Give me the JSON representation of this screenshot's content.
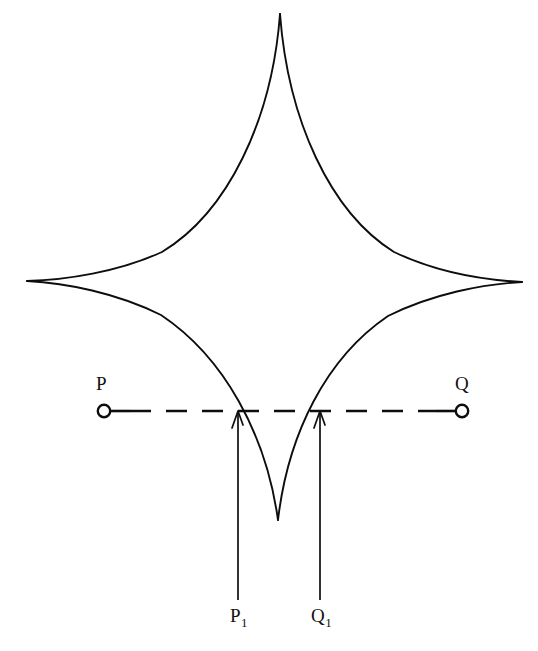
{
  "figure": {
    "kind": "geometric-diagram",
    "background_color": "#ffffff",
    "stroke_color": "#0d0d0d",
    "width": 538,
    "height": 651
  },
  "curve": {
    "name": "astroid",
    "cusp_count": 4,
    "center": {
      "x": 275,
      "y": 281
    },
    "semi_axis_x": 247,
    "semi_axis_y": 267,
    "cusps": {
      "top": {
        "x": 280,
        "y": 14
      },
      "bottom": {
        "x": 278,
        "y": 520
      },
      "left": {
        "x": 27,
        "y": 281
      },
      "right": {
        "x": 522,
        "y": 282
      }
    },
    "stroke_width": 1.9
  },
  "chord": {
    "y": 411,
    "x_start": 104,
    "x_end": 462,
    "dash_on": 21,
    "dash_off": 15,
    "stroke_width": 2.6,
    "endpoint_radius": 6.2
  },
  "labels": {
    "p": "P",
    "q": "Q",
    "p1_base": "P",
    "p1_sub": "1",
    "q1_base": "Q",
    "q1_sub": "1"
  },
  "endpoints": [
    {
      "name": "P",
      "x": 104,
      "y": 411
    },
    {
      "name": "Q",
      "x": 462,
      "y": 411
    }
  ],
  "intersections": [
    {
      "name": "P1",
      "x": 238,
      "y": 411
    },
    {
      "name": "Q1",
      "x": 320,
      "y": 411
    }
  ],
  "pointers": [
    {
      "name": "P1",
      "x": 238,
      "y_tail": 600,
      "y_head": 413
    },
    {
      "name": "Q1",
      "x": 320,
      "y_tail": 600,
      "y_head": 413
    }
  ]
}
